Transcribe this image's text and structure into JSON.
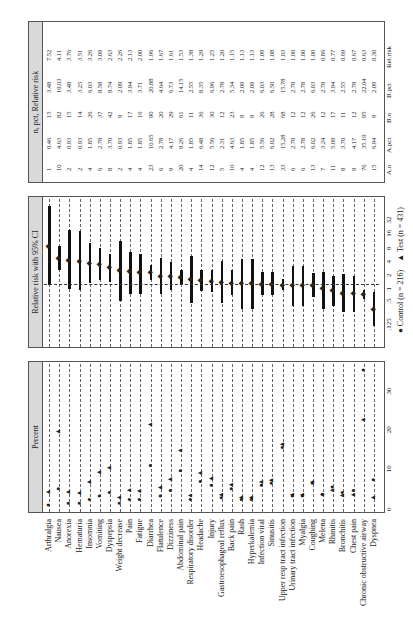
{
  "strips": {
    "percent": "Percent",
    "ci": "Relative risk with 95% CI",
    "table": "n, pct, Relative risk",
    "sort_note": "All sorted by relative risk"
  },
  "legend": {
    "control": "Control (n = 216)",
    "test": "Test (n = 431)"
  },
  "percent_axis": {
    "ticks": [
      "0",
      "10",
      "20",
      "30"
    ]
  },
  "ci_axis": {
    "ticks": [
      ".125",
      ".5",
      "1",
      "2",
      "4",
      "8",
      "16",
      "32"
    ]
  },
  "table_headers": [
    "A.n",
    "A.pct",
    "B.n",
    "B.pct",
    "Rel.risk"
  ],
  "chart_data": [
    {
      "type": "scatter",
      "title": "Percent",
      "xlabel": "Percent",
      "xlim": [
        0,
        35
      ],
      "series": [
        {
          "name": "Control (n = 216)",
          "marker": "circle",
          "values": [
            0.46,
            4.63,
            0.93,
            0.93,
            1.85,
            2.78,
            3.7,
            0.93,
            1.85,
            1.85,
            10.65,
            2.78,
            4.17,
            9.26,
            1.85,
            6.48,
            5.56,
            2.31,
            4.63,
            1.85,
            1.85,
            5.56,
            6.02,
            15.28,
            2.78,
            2.78,
            6.02,
            3.24,
            5.09,
            3.7,
            4.17,
            35.19,
            6.94
          ]
        },
        {
          "name": "Test (n = 431)",
          "marker": "triangle",
          "values": [
            3.48,
            19.03,
            3.48,
            3.25,
            6.03,
            8.58,
            9.74,
            2.09,
            3.94,
            3.71,
            20.88,
            4.64,
            6.73,
            14.15,
            2.55,
            8.35,
            6.96,
            2.78,
            5.34,
            2.09,
            2.09,
            6.03,
            6.5,
            15.78,
            2.78,
            2.78,
            6.03,
            2.78,
            3.94,
            2.55,
            2.78,
            22.04,
            2.09
          ]
        }
      ],
      "categories": [
        "Arthralgia",
        "Nausea",
        "Anorexia",
        "Hematuria",
        "Insomnia",
        "Vomiting",
        "Dyspepsia",
        "Weight decrease",
        "Pain",
        "Fatigue",
        "Diarrhea",
        "Flatulence",
        "Dizziness",
        "Abdominal pain",
        "Respiratory disorder",
        "Headache",
        "Injury",
        "Gastroesophageal reflux",
        "Back pain",
        "Rash",
        "Hyperkalemia",
        "Infection viral",
        "Sinusitis",
        "Upper resp tract infection",
        "Urinary tract infection",
        "Myalgia",
        "Coughing",
        "Melena",
        "Rhinitis",
        "Bronchitis",
        "Chest pain",
        "Chronic obstructive airway",
        "Dyspnea"
      ]
    },
    {
      "type": "scatter",
      "title": "Relative risk with 95% CI",
      "xscale": "log2",
      "xlim": [
        0.0625,
        64
      ],
      "reference_line": 1,
      "categories": [
        "Arthralgia",
        "Nausea",
        "Anorexia",
        "Hematuria",
        "Insomnia",
        "Vomiting",
        "Dyspepsia",
        "Weight decrease",
        "Pain",
        "Fatigue",
        "Diarrhea",
        "Flatulence",
        "Dizziness",
        "Abdominal pain",
        "Respiratory disorder",
        "Headache",
        "Injury",
        "Gastroesophageal reflux",
        "Back pain",
        "Rash",
        "Hyperkalemia",
        "Infection viral",
        "Sinusitis",
        "Upper resp tract infection",
        "Urinary tract infection",
        "Myalgia",
        "Coughing",
        "Melena",
        "Rhinitis",
        "Bronchitis",
        "Chest pain",
        "Chronic obstructive airway",
        "Dyspnea"
      ],
      "relative_risk": [
        7.52,
        4.11,
        3.76,
        3.51,
        3.26,
        3.09,
        2.63,
        2.26,
        2.13,
        2.0,
        1.96,
        1.67,
        1.61,
        1.53,
        1.38,
        1.29,
        1.25,
        1.2,
        1.15,
        1.13,
        1.13,
        1.09,
        1.08,
        1.03,
        1.0,
        1.0,
        1.0,
        0.86,
        0.77,
        0.69,
        0.67,
        0.63,
        0.3
      ],
      "ci_low": [
        1.0,
        2.2,
        0.85,
        0.8,
        1.15,
        1.3,
        1.2,
        0.45,
        0.65,
        0.65,
        1.3,
        0.65,
        0.8,
        1.05,
        0.4,
        0.75,
        0.7,
        0.4,
        0.6,
        0.3,
        0.3,
        0.6,
        0.6,
        0.8,
        0.35,
        0.35,
        0.55,
        0.3,
        0.35,
        0.25,
        0.25,
        0.5,
        0.12
      ],
      "ci_high": [
        60,
        7.5,
        18,
        17,
        9,
        7,
        5,
        10,
        5.5,
        5,
        2.9,
        4.2,
        3.3,
        2.2,
        4.5,
        2.2,
        2.2,
        3.5,
        2.2,
        4,
        3.9,
        2,
        2,
        1.4,
        2.8,
        2.8,
        1.9,
        2,
        1.6,
        1.8,
        1.6,
        0.8,
        0.7
      ]
    },
    {
      "type": "table",
      "title": "n, pct, Relative risk",
      "columns": [
        "A.n",
        "A.pct",
        "B.n",
        "B.pct",
        "Relrisk"
      ],
      "rows": [
        [
          1,
          "0.46",
          15,
          "3.48",
          "7.52"
        ],
        [
          10,
          "4.63",
          82,
          "19.03",
          "4.11"
        ],
        [
          2,
          "0.93",
          15,
          "3.48",
          "3.76"
        ],
        [
          2,
          "0.93",
          14,
          "3.25",
          "3.51"
        ],
        [
          4,
          "1.85",
          26,
          "6.03",
          "3.26"
        ],
        [
          6,
          "2.78",
          37,
          "8.58",
          "3.09"
        ],
        [
          8,
          "3.70",
          42,
          "9.74",
          "2.63"
        ],
        [
          2,
          "0.93",
          9,
          "2.09",
          "2.26"
        ],
        [
          4,
          "1.85",
          17,
          "3.94",
          "2.13"
        ],
        [
          4,
          "1.85",
          16,
          "3.71",
          "2.00"
        ],
        [
          23,
          "10.65",
          90,
          "20.88",
          "1.96"
        ],
        [
          6,
          "2.78",
          20,
          "4.64",
          "1.67"
        ],
        [
          9,
          "4.17",
          29,
          "6.73",
          "1.61"
        ],
        [
          20,
          "9.26",
          61,
          "14.15",
          "1.53"
        ],
        [
          4,
          "1.85",
          11,
          "2.55",
          "1.38"
        ],
        [
          14,
          "6.48",
          36,
          "8.35",
          "1.29"
        ],
        [
          12,
          "5.56",
          30,
          "6.96",
          "1.25"
        ],
        [
          5,
          "2.31",
          12,
          "2.78",
          "1.20"
        ],
        [
          10,
          "4.63",
          23,
          "5.34",
          "1.15"
        ],
        [
          4,
          "1.85",
          9,
          "2.09",
          "1.13"
        ],
        [
          4,
          "1.85",
          9,
          "2.09",
          "1.13"
        ],
        [
          12,
          "5.56",
          26,
          "6.03",
          "1.09"
        ],
        [
          13,
          "6.02",
          28,
          "6.50",
          "1.08"
        ],
        [
          33,
          "15.28",
          68,
          "15.78",
          "1.03"
        ],
        [
          6,
          "2.78",
          12,
          "2.78",
          "1.00"
        ],
        [
          6,
          "2.78",
          12,
          "2.78",
          "1.00"
        ],
        [
          13,
          "6.02",
          26,
          "6.03",
          "1.00"
        ],
        [
          7,
          "3.24",
          12,
          "2.78",
          "0.86"
        ],
        [
          11,
          "5.09",
          17,
          "3.94",
          "0.77"
        ],
        [
          8,
          "3.70",
          11,
          "2.55",
          "0.69"
        ],
        [
          9,
          "4.17",
          12,
          "2.78",
          "0.67"
        ],
        [
          76,
          "35.19",
          95,
          "22.04",
          "0.63"
        ],
        [
          15,
          "6.94",
          9,
          "2.09",
          "0.30"
        ]
      ]
    }
  ]
}
